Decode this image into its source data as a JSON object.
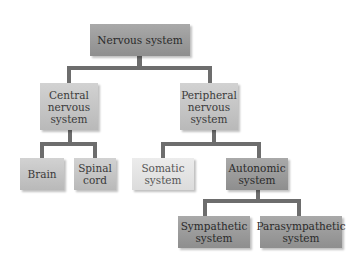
{
  "diagram": {
    "type": "hierarchy",
    "root": {
      "label": "Nervous system",
      "children": [
        {
          "label": "Central nervous system",
          "children": [
            {
              "label": "Brain"
            },
            {
              "label": "Spinal cord"
            }
          ]
        },
        {
          "label": "Peripheral nervous system",
          "children": [
            {
              "label": "Somatic system"
            },
            {
              "label": "Autonomic system",
              "children": [
                {
                  "label": "Sympathetic system"
                },
                {
                  "label": "Parasympathetic system"
                }
              ]
            }
          ]
        }
      ]
    },
    "nodes": {
      "nervous_system": "Nervous system",
      "cns_line1": "Central",
      "cns_line2": "nervous",
      "cns_line3": "system",
      "pns_line1": "Peripheral",
      "pns_line2": "nervous",
      "pns_line3": "system",
      "brain": "Brain",
      "spinal_line1": "Spinal",
      "spinal_line2": "cord",
      "somatic_line1": "Somatic",
      "somatic_line2": "system",
      "autonomic_line1": "Autonomic",
      "autonomic_line2": "system",
      "sympathetic_line1": "Sympathetic",
      "sympathetic_line2": "system",
      "parasympathetic_line1": "Parasympathetic",
      "parasympathetic_line2": "system"
    },
    "colors": {
      "dark_box": "#9a9a9a",
      "mid_box": "#c6c6c6",
      "light_box": "#e4e4e4",
      "connector": "#6d6d6d"
    }
  }
}
